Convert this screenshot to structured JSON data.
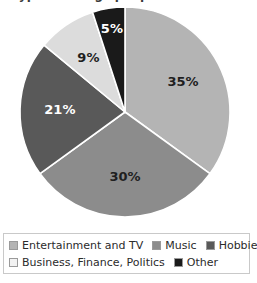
{
  "chart_data": {
    "type": "pie",
    "title": "Types of blogs people read most frequently",
    "title_visible_fragment": "",
    "categories": [
      "Entertainment and TV",
      "Music",
      "Hobbies",
      "Business, Finance, Politics",
      "Other"
    ],
    "values": [
      35,
      30,
      21,
      9,
      5
    ],
    "value_labels": [
      "35%",
      "30%",
      "21%",
      "9%",
      "5%"
    ],
    "colors": [
      "#b4b4b4",
      "#8c8c8c",
      "#595959",
      "#dcdcdc",
      "#1a1a1a"
    ],
    "label_colors": [
      "#1f1f1f",
      "#1f1f1f",
      "#ffffff",
      "#1f1f1f",
      "#ffffff"
    ],
    "units": "percent",
    "start_angle_deg": 0,
    "direction": "clockwise",
    "legend_position": "bottom",
    "legend_rows": [
      [
        0,
        1,
        2
      ],
      [
        3,
        4
      ]
    ],
    "grid": false,
    "xlabel": "",
    "ylabel": ""
  },
  "legend": {
    "items": [
      {
        "label": "Entertainment and TV",
        "color": "#b4b4b4"
      },
      {
        "label": "Music",
        "color": "#8c8c8c"
      },
      {
        "label": "Hobbies",
        "color": "#595959"
      },
      {
        "label": "Business, Finance, Politics",
        "color": "#f2f2f2"
      },
      {
        "label": "Other",
        "color": "#1a1a1a"
      }
    ]
  },
  "slice_labels": {
    "s0": "35%",
    "s1": "30%",
    "s2": "21%",
    "s3": "9%",
    "s4": "5%"
  }
}
